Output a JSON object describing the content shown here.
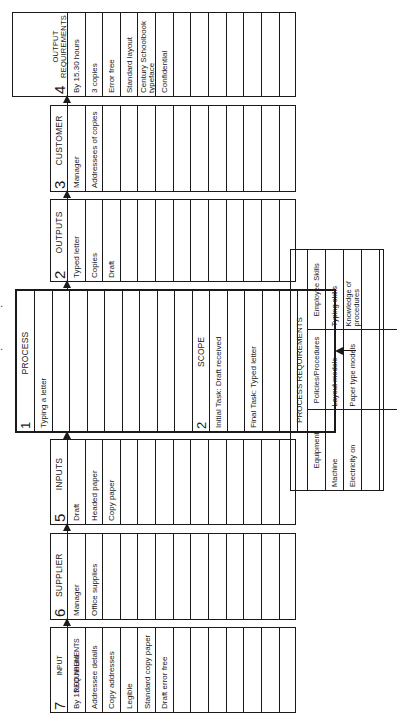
{
  "boxes": {
    "input_requirements": {
      "number": "7",
      "title": "INPUT REQUIREMENTS",
      "rows": [
        "By 15.00 hours",
        "Addressee details",
        "Copy addresses",
        "Legible",
        "Standard copy paper",
        "Draft error free",
        "",
        "",
        "",
        "",
        "",
        "",
        ""
      ]
    },
    "supplier": {
      "number": "6",
      "title": "SUPPLIER",
      "rows": [
        "Manager",
        "Office supplies",
        "",
        "",
        "",
        "",
        "",
        "",
        "",
        "",
        "",
        "",
        ""
      ]
    },
    "inputs": {
      "number": "5",
      "title": "INPUTS",
      "rows": [
        "Draft",
        "Headed paper",
        "Copy paper",
        "",
        "",
        "",
        "",
        "",
        "",
        "",
        "",
        "",
        ""
      ]
    },
    "process": {
      "number": "1",
      "title": "PROCESS",
      "rows": [
        "Typing a letter",
        "",
        "",
        "",
        "",
        "",
        "",
        "",
        "",
        "",
        "",
        "",
        "",
        "",
        "",
        "",
        ""
      ]
    },
    "scope": {
      "number": "2",
      "title": "SCOPE",
      "rows": [
        "Initial Task: Draft received",
        "",
        "Final Task: Typed letter",
        ""
      ]
    },
    "outputs": {
      "number": "2",
      "title": "OUTPUTS",
      "rows": [
        "Typed letter",
        "Copies",
        "Draft",
        "",
        "",
        "",
        "",
        "",
        "",
        "",
        "",
        "",
        ""
      ]
    },
    "customer": {
      "number": "3",
      "title": "CUSTOMER",
      "rows": [
        "Manager",
        "Addressees of copies",
        "",
        "",
        "",
        "",
        "",
        "",
        "",
        "",
        "",
        "",
        ""
      ]
    },
    "output_requirements": {
      "number": "4",
      "title_line1": "OUTPUT",
      "title_line2": "REQUIREMENTS",
      "rows": [
        "By 15.30 hours",
        "3 copies",
        "Error free",
        "Standard layout",
        "Century Schoolbook typeface",
        "Confidential",
        "",
        "",
        "",
        "",
        "",
        "",
        ""
      ]
    }
  },
  "process_requirements": {
    "title": "PROCESS REQUIREMENTS",
    "columns": [
      "Equipment",
      "Policies/Procedures",
      "Employee Skills"
    ],
    "rows": [
      [
        "Machine",
        "Layout models",
        "Typing skills"
      ],
      [
        "Electricity on",
        "Paper type models",
        "Knowledge of procedures"
      ],
      [
        "",
        "",
        ""
      ],
      [
        "",
        "",
        ""
      ]
    ]
  }
}
